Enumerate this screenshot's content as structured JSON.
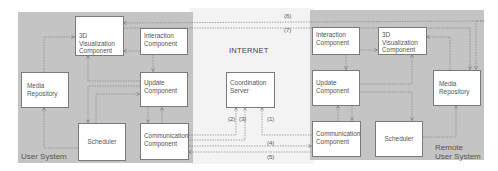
{
  "diagram": {
    "internet_label": "INTERNET",
    "local_system": {
      "label": "User System",
      "components": {
        "visualization": "3D Visualization Component",
        "interaction": "Interaction Component",
        "media": "Media Repository",
        "update": "Update Component",
        "scheduler": "Scheduler",
        "communication": "Communication Component"
      }
    },
    "remote_system": {
      "label_line1": "Remote",
      "label_line2": "User System",
      "components": {
        "interaction": "Interaction Component",
        "visualization": "3D Visualization Component",
        "update": "Update Component",
        "media": "Media Repository",
        "communication": "Communication Component",
        "scheduler": "Scheduler"
      }
    },
    "server": {
      "label": "Coordination Server"
    },
    "connection_labels": [
      "(1)",
      "(2)",
      "(3)",
      "(4)",
      "(5)",
      "(6)",
      "(7)"
    ],
    "colors": {
      "panel_bg": "#c4c4c4",
      "internet_bg": "#f3f3f3",
      "box_bg": "#ffffff",
      "line": "#7a7a7a"
    }
  }
}
